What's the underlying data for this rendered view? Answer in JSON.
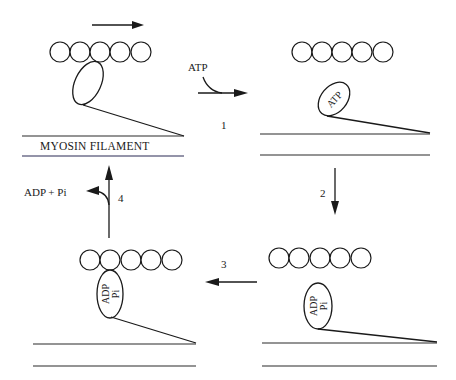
{
  "diagram": {
    "type": "cross-bridge cycle",
    "filament_label": "MYOSIN FILAMENT",
    "top_motion_arrow": "right",
    "panels": [
      {
        "id": "panel-1",
        "position": "top-left",
        "state": "attached, rigor",
        "head_label": "",
        "actin_beads": 5
      },
      {
        "id": "panel-2",
        "position": "top-right",
        "state": "detached, ATP bound",
        "head_label": "ATP",
        "actin_beads": 5
      },
      {
        "id": "panel-3",
        "position": "bottom-right",
        "state": "detached, cocked",
        "head_label_line1": "ADP",
        "head_label_line2": "Pi",
        "actin_beads": 5
      },
      {
        "id": "panel-4",
        "position": "bottom-left",
        "state": "attached, ADP+Pi bound",
        "head_label_line1": "ADP",
        "head_label_line2": "Pi",
        "actin_beads": 5
      }
    ],
    "steps": [
      {
        "number": "1",
        "input": "ATP",
        "direction": "right"
      },
      {
        "number": "2",
        "direction": "down"
      },
      {
        "number": "3",
        "direction": "left"
      },
      {
        "number": "4",
        "output": "ADP + Pi",
        "direction": "up"
      }
    ],
    "colors": {
      "ink": "#1a1a1a",
      "background": "#ffffff"
    }
  }
}
